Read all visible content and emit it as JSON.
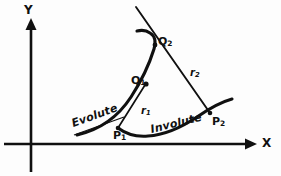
{
  "figure": {
    "background_color": "#fdfdfd",
    "ink_color": "#101010"
  },
  "axes": {
    "x_label": "X",
    "y_label": "Y",
    "origin": {
      "x": 31,
      "y": 144
    },
    "x_axis": {
      "from_x": 4,
      "to_x": 252,
      "y": 144,
      "arrow": "right"
    },
    "y_axis": {
      "x": 31,
      "from_y": 170,
      "to_y": 22,
      "arrow": "up"
    }
  },
  "curves": [
    {
      "name": "evolute",
      "label": "Evolute",
      "style": "bold-solid",
      "description": "Concave curve running from lower-left through Q1 up to Q2 and hooking left at top"
    },
    {
      "name": "involute",
      "label": "Involute",
      "style": "bold-solid",
      "description": "Curve running from P1 along the bottom up to the right through P2"
    }
  ],
  "radii": [
    {
      "name": "r1",
      "label": "r",
      "subscript": "1",
      "from_point": "Q1",
      "to_point": "P1",
      "style": "thin-straight"
    },
    {
      "name": "r2",
      "label": "r",
      "subscript": "2",
      "from_point": "Q2",
      "to_point": "P2",
      "style": "thin-straight"
    }
  ],
  "points": [
    {
      "name": "Q1",
      "label": "Q",
      "subscript": "1",
      "on_curve": "evolute"
    },
    {
      "name": "Q2",
      "label": "Q",
      "subscript": "2",
      "on_curve": "evolute"
    },
    {
      "name": "P1",
      "label": "P",
      "subscript": "1",
      "on_curve": "involute"
    },
    {
      "name": "P2",
      "label": "P",
      "subscript": "2",
      "on_curve": "involute"
    }
  ],
  "artifacts": {
    "top_bleed_text": "",
    "bottom_bleed_text": ""
  }
}
